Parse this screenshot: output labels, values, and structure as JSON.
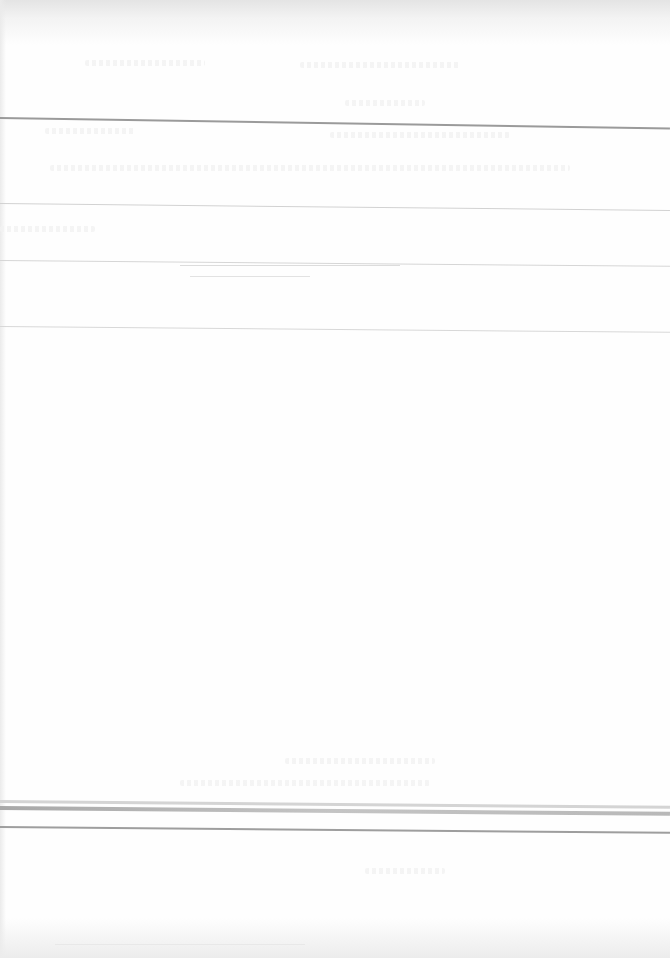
{
  "document": {
    "type": "faded scanned printed page",
    "header": {
      "line_1": "",
      "line_2": ""
    },
    "sections": [
      {
        "label": "",
        "text": ""
      },
      {
        "label": "",
        "text": ""
      },
      {
        "label": "",
        "text": ""
      }
    ],
    "footer": {
      "line_1": "",
      "line_2": ""
    }
  },
  "style": {
    "paper_color": "#fefefe",
    "rule_color": "#9a9a9a",
    "faint_rule_color": "#d6d6d6",
    "shadow_color": "#e4e4e4"
  }
}
